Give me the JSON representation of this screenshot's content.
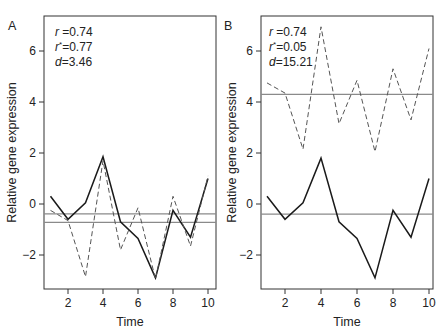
{
  "figure": {
    "ylabel": "Relative gene expression",
    "xlabel": "Time"
  },
  "chart_data": [
    {
      "type": "line",
      "panel": "A",
      "title": "",
      "xlabel": "Time",
      "ylabel": "Relative gene expression",
      "x": [
        1,
        2,
        3,
        4,
        5,
        6,
        7,
        8,
        9,
        10
      ],
      "xticks": [
        2,
        4,
        6,
        8,
        10
      ],
      "yticks": [
        -2,
        0,
        2,
        4,
        6
      ],
      "xlim": [
        0.7,
        10.3
      ],
      "ylim": [
        -3.35,
        7.35
      ],
      "grid": false,
      "annotations": [
        {
          "var": "r",
          "sup": "",
          "value": "0.74"
        },
        {
          "var": "r",
          "sup": "*",
          "value": "0.77"
        },
        {
          "var": "d",
          "sup": "",
          "value": "3.46"
        }
      ],
      "series": [
        {
          "name": "gene 1",
          "style": "solid",
          "values": [
            0.3,
            -0.6,
            0.05,
            1.85,
            -0.7,
            -1.35,
            -2.9,
            -0.25,
            -1.3,
            1.0
          ]
        },
        {
          "name": "gene 2",
          "style": "dashed",
          "values": [
            -0.25,
            -0.65,
            -2.85,
            1.7,
            -1.8,
            -0.15,
            -2.95,
            0.3,
            -1.65,
            1.1
          ]
        }
      ],
      "hlines": [
        {
          "label": "mean gene 1",
          "y": -0.39
        },
        {
          "label": "mean gene 2",
          "y": -0.72
        }
      ]
    },
    {
      "type": "line",
      "panel": "B",
      "title": "",
      "xlabel": "Time",
      "ylabel": "Relative gene expression",
      "x": [
        1,
        2,
        3,
        4,
        5,
        6,
        7,
        8,
        9,
        10
      ],
      "xticks": [
        2,
        4,
        6,
        8,
        10
      ],
      "yticks": [
        -2,
        0,
        2,
        4,
        6
      ],
      "xlim": [
        0.7,
        10.3
      ],
      "ylim": [
        -3.35,
        7.35
      ],
      "grid": false,
      "annotations": [
        {
          "var": "r",
          "sup": "",
          "value": "0.74"
        },
        {
          "var": "r",
          "sup": "*",
          "value": "0.05"
        },
        {
          "var": "d",
          "sup": "",
          "value": "15.21"
        }
      ],
      "series": [
        {
          "name": "gene 1",
          "style": "solid",
          "values": [
            0.3,
            -0.6,
            0.05,
            1.8,
            -0.7,
            -1.35,
            -2.9,
            -0.25,
            -1.3,
            1.0
          ]
        },
        {
          "name": "gene 2",
          "style": "dashed",
          "values": [
            4.75,
            4.35,
            2.15,
            6.95,
            3.15,
            4.85,
            2.05,
            5.3,
            3.3,
            6.1
          ]
        }
      ],
      "hlines": [
        {
          "label": "mean gene 1",
          "y": -0.4
        },
        {
          "label": "mean gene 2",
          "y": 4.3
        }
      ]
    }
  ],
  "layout": {
    "panels": [
      {
        "letter": "A",
        "box": {
          "left": 44,
          "top": 16,
          "right": 216,
          "bottom": 289
        },
        "letter_pos": [
          8,
          30
        ],
        "stats_pos": [
          55,
          36
        ],
        "ylabel_x": 16,
        "x1": 50.5,
        "xstep": 17.5
      },
      {
        "letter": "B",
        "box": {
          "left": 261,
          "top": 16,
          "right": 433,
          "bottom": 289
        },
        "letter_pos": [
          224,
          30
        ],
        "stats_pos": [
          269,
          36
        ],
        "ylabel_x": 236,
        "x1": 267,
        "xstep": 18
      }
    ],
    "y0_px": 204,
    "y_px_per_unit": 25.5,
    "colors": {
      "line": "#1a1a1a",
      "dashed": "#555555",
      "mean_line": "#8a8a8a",
      "axis": "#333333"
    }
  }
}
